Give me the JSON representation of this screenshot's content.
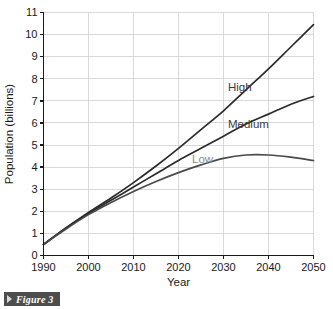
{
  "caption": {
    "arrow_icon": "triangle-right-icon",
    "text": "Figure 3"
  },
  "chart_data": {
    "type": "line",
    "title": "",
    "xlabel": "Year",
    "ylabel": "Population (billions)",
    "xlim": [
      1990,
      2050
    ],
    "ylim": [
      0,
      11
    ],
    "grid": true,
    "legend_position": "inline-labels",
    "xticks": [
      1990,
      2000,
      2010,
      2020,
      2030,
      2040,
      2050
    ],
    "yticks": [
      0,
      1,
      2,
      3,
      4,
      5,
      6,
      7,
      8,
      9,
      10,
      11
    ],
    "xtick_labels": [
      "1990",
      "2000",
      "2010",
      "2020",
      "2030",
      "2040",
      "2050"
    ],
    "ytick_labels": [
      "0",
      "1",
      "2",
      "3",
      "4",
      "5",
      "6",
      "7",
      "8",
      "9",
      "10",
      "11"
    ],
    "x": [
      1990,
      1995,
      2000,
      2005,
      2010,
      2015,
      2020,
      2025,
      2030,
      2035,
      2040,
      2045,
      2050
    ],
    "series": [
      {
        "name": "High",
        "label": "High",
        "color": "#2b2b2b",
        "label_color": "#3d3d3d",
        "label_x": 2031,
        "label_y": 7.45,
        "values": [
          0.5,
          1.25,
          1.95,
          2.6,
          3.3,
          4.05,
          4.85,
          5.7,
          6.55,
          7.5,
          8.45,
          9.45,
          10.45
        ]
      },
      {
        "name": "Medium",
        "label": "Medium",
        "color": "#2b2b2b",
        "label_color": "#3d3d3d",
        "label_x": 2031,
        "label_y": 5.75,
        "values": [
          0.5,
          1.25,
          1.9,
          2.5,
          3.1,
          3.7,
          4.3,
          4.85,
          5.4,
          5.95,
          6.4,
          6.85,
          7.2
        ]
      },
      {
        "name": "Low",
        "label": "Low",
        "color": "#4a4a4a",
        "label_color": "#8a8a8a",
        "label_x": 2023,
        "label_y": 4.2,
        "values": [
          0.5,
          1.2,
          1.85,
          2.4,
          2.9,
          3.35,
          3.75,
          4.1,
          4.4,
          4.55,
          4.55,
          4.45,
          4.3
        ]
      }
    ]
  }
}
